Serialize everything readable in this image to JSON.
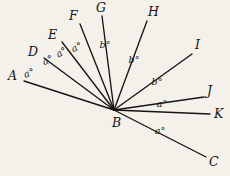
{
  "figure": {
    "type": "angle-diagram",
    "background_color": "#f4f1ea",
    "line_color": "#161412",
    "vertex": {
      "name": "B",
      "label": "B",
      "x": 114,
      "y": 110,
      "label_x": 112,
      "label_y": 127
    },
    "rays": [
      {
        "name": "A",
        "label": "A",
        "end_x": 24,
        "end_y": 81,
        "label_x": 8,
        "label_y": 80
      },
      {
        "name": "D",
        "label": "D",
        "end_x": 44,
        "end_y": 58,
        "label_x": 28,
        "label_y": 56
      },
      {
        "name": "E",
        "label": "E",
        "end_x": 62,
        "end_y": 42,
        "label_x": 48,
        "label_y": 39
      },
      {
        "name": "F",
        "label": "F",
        "end_x": 80,
        "end_y": 24,
        "label_x": 69,
        "label_y": 20
      },
      {
        "name": "G",
        "label": "G",
        "end_x": 102,
        "end_y": 16,
        "label_x": 96,
        "label_y": 12
      },
      {
        "name": "H",
        "label": "H",
        "end_x": 147,
        "end_y": 21,
        "label_x": 148,
        "label_y": 16
      },
      {
        "name": "I",
        "label": "I",
        "end_x": 192,
        "end_y": 54,
        "label_x": 195,
        "label_y": 49
      },
      {
        "name": "J",
        "label": "J",
        "end_x": 204,
        "end_y": 97,
        "label_x": 207,
        "label_y": 95
      },
      {
        "name": "K",
        "label": "K",
        "end_x": 210,
        "end_y": 114,
        "label_x": 214,
        "label_y": 118
      },
      {
        "name": "C",
        "label": "C",
        "end_x": 206,
        "end_y": 157,
        "label_x": 209,
        "label_y": 166
      }
    ],
    "angle_labels": [
      {
        "text": "a°",
        "x": 30,
        "y": 76,
        "rotate": -19,
        "between": "A-D"
      },
      {
        "text": "a°",
        "x": 49,
        "y": 63,
        "rotate": -26,
        "between": "D-E"
      },
      {
        "text": "a°",
        "x": 63,
        "y": 55,
        "rotate": -32,
        "between": "E-F"
      },
      {
        "text": "a°",
        "x": 78,
        "y": 50,
        "rotate": -26,
        "between": "F-G"
      },
      {
        "text": "b°",
        "x": 105,
        "y": 48,
        "rotate": 0,
        "between": "G-H"
      },
      {
        "text": "b°",
        "x": 134,
        "y": 63,
        "rotate": 0,
        "between": "H-I"
      },
      {
        "text": "b°",
        "x": 157,
        "y": 85,
        "rotate": 0,
        "between": "I-J"
      },
      {
        "text": "a°",
        "x": 162,
        "y": 107,
        "rotate": 0,
        "between": "J-K"
      },
      {
        "text": "a°",
        "x": 160,
        "y": 134,
        "rotate": 0,
        "between": "K-C"
      }
    ]
  }
}
